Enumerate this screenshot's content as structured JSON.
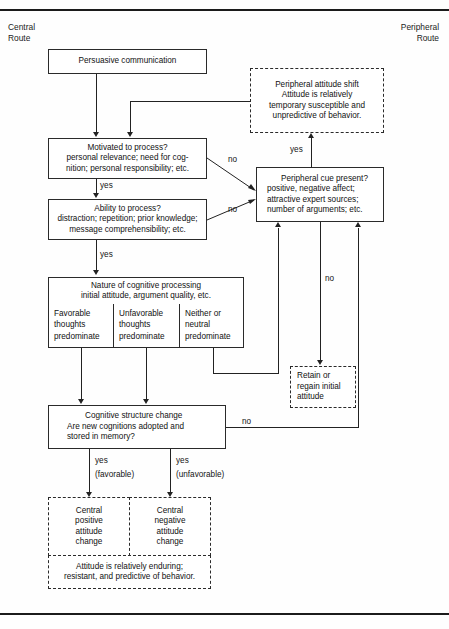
{
  "figure": {
    "left_route": "Central\nRoute",
    "right_route": "Peripheral\nRoute"
  },
  "nodes": {
    "persuasive": {
      "lines": [
        "Persuasive communication"
      ]
    },
    "motivated": {
      "lines": [
        "Motivated to process?",
        "personal relevance; need for cog-",
        "nition; personal responsibility; etc."
      ]
    },
    "ability": {
      "lines": [
        "Ability to process?",
        "distraction; repetition; prior knowledge;",
        "message comprehensibility; etc."
      ]
    },
    "nature": {
      "lines": [
        "Nature of cognitive processing",
        "initial attitude, argument quality, etc."
      ]
    },
    "favorable": {
      "lines": [
        "Favorable",
        "thoughts",
        "predominate"
      ]
    },
    "unfavorable": {
      "lines": [
        "Unfavorable",
        "thoughts",
        "predominate"
      ]
    },
    "neither": {
      "lines": [
        "Neither or",
        "neutral",
        "predominate"
      ]
    },
    "cognitive_structure": {
      "lines": [
        "Cognitive structure change",
        "Are new cognitions adopted and",
        "stored in memory?"
      ]
    },
    "peripheral_shift": {
      "lines": [
        "Peripheral attitude shift",
        "Attitude is relatively",
        "temporary susceptible and",
        "unpredictive of behavior."
      ]
    },
    "peripheral_cue": {
      "lines": [
        "Peripheral cue present?",
        "positive, negative affect;",
        "attractive expert sources;",
        "number of arguments; etc."
      ]
    },
    "retain": {
      "lines": [
        "Retain or",
        "regain initial",
        "attitude"
      ]
    },
    "central_positive": {
      "lines": [
        "Central",
        "positive",
        "attitude",
        "change"
      ]
    },
    "central_negative": {
      "lines": [
        "Central",
        "negative",
        "attitude",
        "change"
      ]
    },
    "enduring": {
      "lines": [
        "Attitude is relatively enduring;",
        "resistant, and predictive of behavior."
      ]
    }
  },
  "edge_labels": {
    "motivated_yes": "yes",
    "motivated_no": "no",
    "ability_yes": "yes",
    "ability_no": "no",
    "nature_yes": "yes",
    "cue_yes": "yes",
    "cue_no": "no",
    "cognitive_no": "no",
    "cognitive_yes_fav": "yes",
    "cognitive_yes_fav2": "(favorable)",
    "cognitive_yes_unfav": "yes",
    "cognitive_yes_unfav2": "(unfavorable)",
    "neither_no": "no"
  },
  "colors": {
    "ink": "#1b1b1b",
    "stroke": "#222222",
    "paper": "#fefefe"
  }
}
